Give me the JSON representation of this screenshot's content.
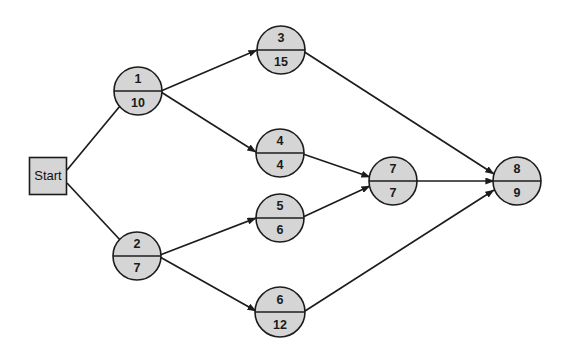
{
  "diagram": {
    "type": "directed-graph",
    "colors": {
      "node_fill": "#d5d5d5",
      "node_stroke": "#1c1c1c",
      "edge_stroke": "#1c1c1c",
      "background": "#ffffff",
      "text": "#1a1a1a"
    },
    "start": {
      "id": "start",
      "label": "Start",
      "shape": "square",
      "x": 48,
      "y": 176,
      "width": 37,
      "height": 37
    },
    "nodes": [
      {
        "id": "n1",
        "top": "1",
        "bottom": "10",
        "x": 138,
        "y": 91,
        "r": 24
      },
      {
        "id": "n2",
        "top": "2",
        "bottom": "7",
        "x": 137,
        "y": 256,
        "r": 24
      },
      {
        "id": "n3",
        "top": "3",
        "bottom": "15",
        "x": 281,
        "y": 50,
        "r": 24
      },
      {
        "id": "n4",
        "top": "4",
        "bottom": "4",
        "x": 280,
        "y": 153,
        "r": 24
      },
      {
        "id": "n5",
        "top": "5",
        "bottom": "6",
        "x": 280,
        "y": 218,
        "r": 24
      },
      {
        "id": "n6",
        "top": "6",
        "bottom": "12",
        "x": 280,
        "y": 312,
        "r": 25
      },
      {
        "id": "n7",
        "top": "7",
        "bottom": "7",
        "x": 393,
        "y": 181,
        "r": 24
      },
      {
        "id": "n8",
        "top": "8",
        "bottom": "9",
        "x": 517,
        "y": 181,
        "r": 24
      }
    ],
    "edges": [
      {
        "id": "e-start-n1",
        "from": "start",
        "to": "n1",
        "x1": 67,
        "y1": 170,
        "x2": 120,
        "y2": 106,
        "arrow": false
      },
      {
        "id": "e-start-n2",
        "from": "start",
        "to": "n2",
        "x1": 67,
        "y1": 183,
        "x2": 122,
        "y2": 242,
        "arrow": false
      },
      {
        "id": "e-n1-n3",
        "from": "n1",
        "to": "n3",
        "x1": 161,
        "y1": 91,
        "x2": 257,
        "y2": 50,
        "arrow": true
      },
      {
        "id": "e-n1-n4",
        "from": "n1",
        "to": "n4",
        "x1": 161,
        "y1": 92,
        "x2": 256,
        "y2": 152,
        "arrow": true
      },
      {
        "id": "e-n2-n5",
        "from": "n2",
        "to": "n5",
        "x1": 160,
        "y1": 255,
        "x2": 256,
        "y2": 218,
        "arrow": true
      },
      {
        "id": "e-n2-n6",
        "from": "n2",
        "to": "n6",
        "x1": 160,
        "y1": 257,
        "x2": 256,
        "y2": 311,
        "arrow": true
      },
      {
        "id": "e-n3-n8",
        "from": "n3",
        "to": "n8",
        "x1": 303,
        "y1": 51,
        "x2": 494,
        "y2": 174,
        "arrow": true
      },
      {
        "id": "e-n4-n7",
        "from": "n4",
        "to": "n7",
        "x1": 303,
        "y1": 154,
        "x2": 370,
        "y2": 177,
        "arrow": true
      },
      {
        "id": "e-n5-n7",
        "from": "n5",
        "to": "n7",
        "x1": 303,
        "y1": 217,
        "x2": 370,
        "y2": 186,
        "arrow": true
      },
      {
        "id": "e-n7-n8",
        "from": "n7",
        "to": "n8",
        "x1": 417,
        "y1": 181,
        "x2": 494,
        "y2": 181,
        "arrow": true
      },
      {
        "id": "e-n6-n8",
        "from": "n6",
        "to": "n8",
        "x1": 305,
        "y1": 311,
        "x2": 494,
        "y2": 190,
        "arrow": true
      }
    ]
  }
}
